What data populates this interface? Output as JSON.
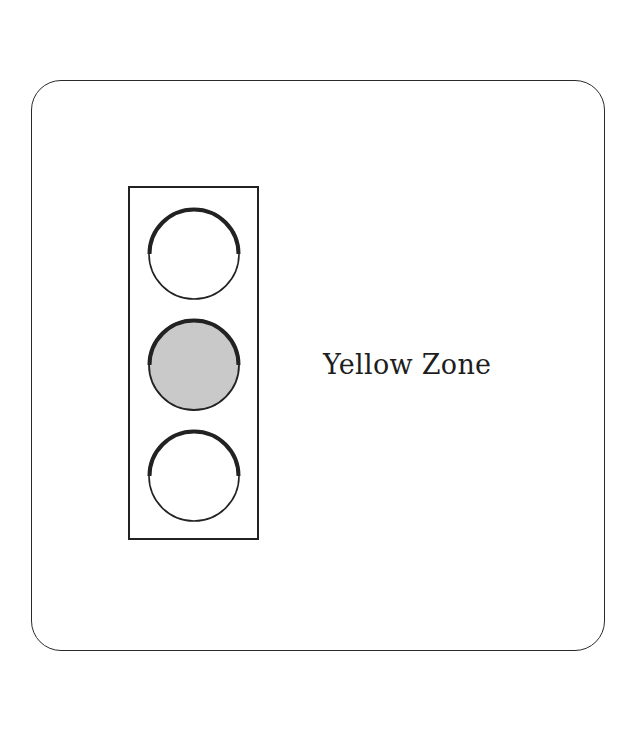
{
  "diagram": {
    "type": "traffic-light-zone-indicator",
    "label": "Yellow Zone",
    "lights": [
      {
        "position": "top",
        "active": false,
        "fill": "#ffffff"
      },
      {
        "position": "middle",
        "active": true,
        "fill": "#c9c9c9"
      },
      {
        "position": "bottom",
        "active": false,
        "fill": "#ffffff"
      }
    ],
    "colors": {
      "stroke": "#222222",
      "active_fill": "#c9c9c9",
      "background": "#ffffff"
    }
  }
}
